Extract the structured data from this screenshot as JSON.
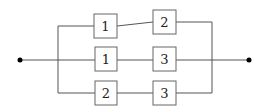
{
  "diagram": {
    "type": "reliability-block-diagram",
    "terminals": [
      {
        "id": "input",
        "x": 20,
        "y": 60
      },
      {
        "id": "output",
        "x": 249,
        "y": 60
      }
    ],
    "bus": {
      "left_x": 58,
      "right_x": 212
    },
    "paths": [
      {
        "y": 26,
        "blocks": [
          {
            "label": "1",
            "x": 94,
            "y": 14
          },
          {
            "label": "2",
            "x": 153,
            "y": 11
          }
        ]
      },
      {
        "y": 60,
        "blocks": [
          {
            "label": "1",
            "x": 95,
            "y": 47
          },
          {
            "label": "3",
            "x": 153,
            "y": 47
          }
        ]
      },
      {
        "y": 93,
        "blocks": [
          {
            "label": "2",
            "x": 95,
            "y": 81
          },
          {
            "label": "3",
            "x": 153,
            "y": 81
          }
        ]
      }
    ],
    "colors": {
      "line": "#555555",
      "box_border": "#666666",
      "dot": "#000000"
    }
  },
  "labels": {
    "p0b0": "1",
    "p0b1": "2",
    "p1b0": "1",
    "p1b1": "3",
    "p2b0": "2",
    "p2b1": "3"
  }
}
